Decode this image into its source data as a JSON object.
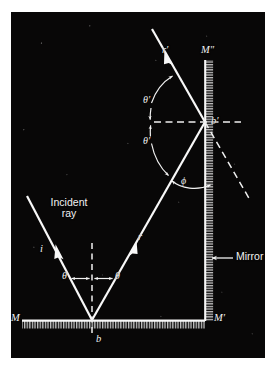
{
  "figure": {
    "background_color": "#080707",
    "ink_color": "#f2f2f2",
    "plate": {
      "x": 11,
      "y": 12,
      "width": 254,
      "height": 346
    }
  },
  "labels": {
    "incident_ray_line1": "Incident",
    "incident_ray_line2": "ray",
    "incident_ray_symbol": "i",
    "reflected_ray_symbol": "r",
    "second_reflected_ray_symbol": "r′",
    "mirror_callout": "Mirror",
    "vertex_bottom": "b",
    "vertex_upper": "b′",
    "mirror_bottom_left": "M",
    "mirror_bottom_right": "M′",
    "mirror_vertical_top": "M″",
    "angle_theta_left": "θ",
    "angle_theta_right": "θ",
    "angle_theta_prime_upper": "θ′",
    "angle_theta_prime_lower": "θ′",
    "angle_phi": "ϕ"
  },
  "geometry": {
    "bottom_mirror": {
      "x1": 22,
      "y1": 320,
      "x2": 205,
      "y2": 320
    },
    "vertical_mirror": {
      "x1": 205,
      "y1": 60,
      "x2": 205,
      "y2": 320
    },
    "incident_ray": {
      "x1": 27,
      "y1": 196,
      "x2": 92,
      "y2": 320
    },
    "reflected_ray": {
      "x1": 92,
      "y1": 320,
      "x2": 205,
      "y2": 122
    },
    "second_reflected_ray": {
      "x1": 205,
      "y1": 122,
      "x2": 155,
      "y2": 32
    },
    "normal_bottom_dashed": {
      "x1": 92,
      "y1": 243,
      "x2": 92,
      "y2": 333
    },
    "normal_upper_dashed": {
      "x1": 158,
      "y1": 122,
      "x2": 238,
      "y2": 122
    },
    "extension_dashed": {
      "x1": 205,
      "y1": 122,
      "x2": 247,
      "y2": 197
    },
    "mirror_arrow": {
      "x1": 232,
      "y1": 258,
      "x2": 210,
      "y2": 258
    }
  },
  "colors": {
    "ink": "#f2f2f2",
    "plate": "#080707",
    "page": "#ffffff"
  }
}
